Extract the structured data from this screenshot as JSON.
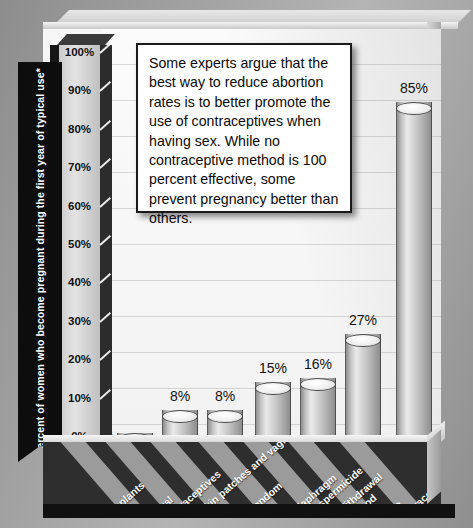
{
  "chart_data": {
    "type": "bar",
    "title": "",
    "xlabel": "",
    "ylabel": "Percent of women who become pregnant during the first year of typical use*",
    "ylim": [
      0,
      100
    ],
    "ytick_labels": [
      "100%",
      "90%",
      "80%",
      "70%",
      "60%",
      "50%",
      "40%",
      "30%",
      "20%",
      "10%",
      "0%"
    ],
    "yticks": [
      100,
      90,
      80,
      70,
      60,
      50,
      40,
      30,
      20,
      10,
      0
    ],
    "grid": true,
    "legend": "none",
    "categories": [
      "Implants",
      "Oral contraceptives",
      "Skin patches and vaginal rings",
      "Condom",
      "Diaphragm with spermicide",
      "Withdrawal method",
      "No contraceptive used"
    ],
    "values": [
      0.5,
      8,
      8,
      15,
      16,
      27,
      85
    ],
    "data_labels": [
      "0.5%",
      "8%",
      "8%",
      "15%",
      "16%",
      "27%",
      "85%"
    ]
  },
  "callout": {
    "text": "Some experts argue that the best way to reduce abortion rates is to better promote the use of contraceptives when having sex. While no contraceptive method is 100 percent effective, some prevent pregnancy better than others."
  },
  "colors": {
    "bar_light": "#eaeaea",
    "bar_mid": "#c3c3c3",
    "bar_dark": "#8e8e8e",
    "axis_band": "#2e2e2e",
    "stripe": "#9b9b9b",
    "banner": "#0d0d0d",
    "plot_bg": "#fbfbfb"
  }
}
